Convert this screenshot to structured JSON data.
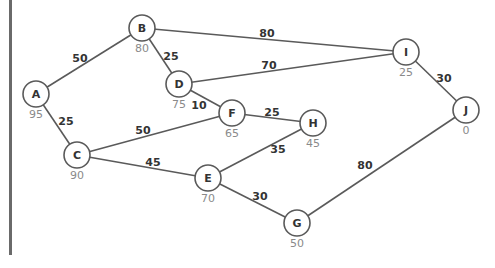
{
  "graph": {
    "nodes": [
      {
        "id": "A",
        "label": "A",
        "value": "95",
        "x": 36,
        "y": 94
      },
      {
        "id": "B",
        "label": "B",
        "value": "80",
        "x": 142,
        "y": 28
      },
      {
        "id": "C",
        "label": "C",
        "value": "90",
        "x": 77,
        "y": 155
      },
      {
        "id": "D",
        "label": "D",
        "value": "75",
        "x": 179,
        "y": 84
      },
      {
        "id": "E",
        "label": "E",
        "value": "70",
        "x": 208,
        "y": 178
      },
      {
        "id": "F",
        "label": "F",
        "value": "65",
        "x": 232,
        "y": 113
      },
      {
        "id": "G",
        "label": "G",
        "value": "50",
        "x": 297,
        "y": 223
      },
      {
        "id": "H",
        "label": "H",
        "value": "45",
        "x": 313,
        "y": 123
      },
      {
        "id": "I",
        "label": "I",
        "value": "25",
        "x": 406,
        "y": 52
      },
      {
        "id": "J",
        "label": "J",
        "value": "0",
        "x": 466,
        "y": 110
      }
    ],
    "edges": [
      {
        "from": "A",
        "to": "B",
        "weight": "50",
        "lx": 80,
        "ly": 58
      },
      {
        "from": "A",
        "to": "C",
        "weight": "25",
        "lx": 66,
        "ly": 121
      },
      {
        "from": "B",
        "to": "D",
        "weight": "25",
        "lx": 171,
        "ly": 56
      },
      {
        "from": "B",
        "to": "I",
        "weight": "80",
        "lx": 267,
        "ly": 33
      },
      {
        "from": "D",
        "to": "I",
        "weight": "70",
        "lx": 269,
        "ly": 65
      },
      {
        "from": "D",
        "to": "F",
        "weight": "10",
        "lx": 199,
        "ly": 105
      },
      {
        "from": "F",
        "to": "H",
        "weight": "25",
        "lx": 272,
        "ly": 112
      },
      {
        "from": "C",
        "to": "F",
        "weight": "50",
        "lx": 143,
        "ly": 130
      },
      {
        "from": "C",
        "to": "E",
        "weight": "45",
        "lx": 153,
        "ly": 162
      },
      {
        "from": "E",
        "to": "H",
        "weight": "35",
        "lx": 278,
        "ly": 149
      },
      {
        "from": "E",
        "to": "G",
        "weight": "30",
        "lx": 260,
        "ly": 196
      },
      {
        "from": "G",
        "to": "J",
        "weight": "80",
        "lx": 365,
        "ly": 165
      },
      {
        "from": "I",
        "to": "J",
        "weight": "30",
        "lx": 444,
        "ly": 78
      }
    ]
  },
  "style": {
    "edge_color": "#5a5a5a",
    "node_value_color": "#8a8a8a",
    "label_color": "#333333",
    "bar_color": "#6a6a6a"
  }
}
